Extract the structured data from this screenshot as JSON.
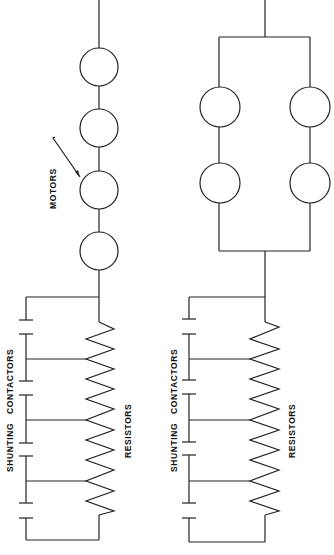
{
  "diagram": {
    "type": "electrical-schematic",
    "circuits": [
      {
        "id": "series",
        "description": "Four motors in series with resistor bank and shunting contactors",
        "motors": 4,
        "motor_label": "MOTORS",
        "contactor_label": "SHUNTING   CONTACTORS",
        "resistor_label": "RESISTORS"
      },
      {
        "id": "series-parallel",
        "description": "Two parallel branches of two series motors with resistor bank and shunting contactors",
        "motors": 4,
        "contactor_label": "SHUNTING   CONTACTORS",
        "resistor_label": "RESISTORS"
      }
    ]
  }
}
